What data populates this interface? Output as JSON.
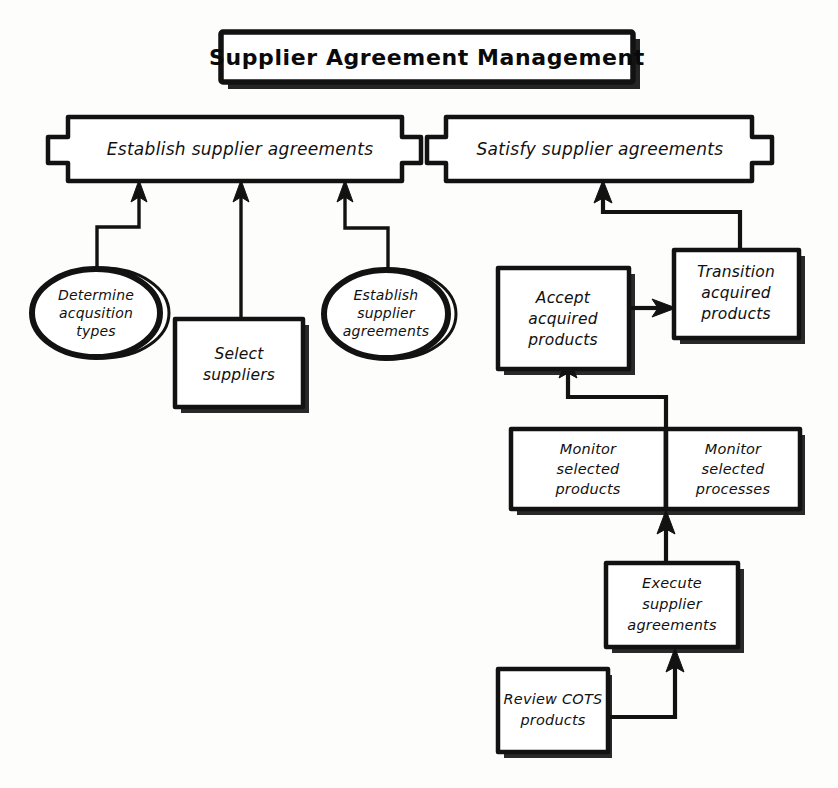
{
  "diagram": {
    "title": "Supplier Agreement Management",
    "style": "hand-drawn flowchart",
    "ink_color": "#121212",
    "background_color": "#fdfdfc",
    "process_areas": [
      {
        "id": "establish",
        "label": "Establish supplier agreements"
      },
      {
        "id": "satisfy",
        "label": "Satisfy supplier agreements"
      }
    ],
    "nodes": [
      {
        "id": "determine-acquisition-types",
        "shape": "ellipse",
        "label_lines": [
          "Determine",
          "acqusition",
          "types"
        ]
      },
      {
        "id": "select-suppliers",
        "shape": "box",
        "label_lines": [
          "Select",
          "suppliers"
        ]
      },
      {
        "id": "establish-supplier-agreements",
        "shape": "ellipse",
        "label_lines": [
          "Establish",
          "supplier",
          "agreements"
        ]
      },
      {
        "id": "accept-acquired-products",
        "shape": "box",
        "label_lines": [
          "Accept",
          "acquired",
          "products"
        ]
      },
      {
        "id": "transition-acquired-products",
        "shape": "box",
        "label_lines": [
          "Transition",
          "acquired",
          "products"
        ]
      },
      {
        "id": "monitor-selected-products",
        "shape": "box",
        "label_lines": [
          "Monitor",
          "selected",
          "products"
        ]
      },
      {
        "id": "monitor-selected-processes",
        "shape": "box",
        "label_lines": [
          "Monitor",
          "selected",
          "processes"
        ]
      },
      {
        "id": "execute-supplier-agreements",
        "shape": "box",
        "label_lines": [
          "Execute",
          "supplier",
          "agreements"
        ]
      },
      {
        "id": "review-cots-products",
        "shape": "box",
        "label_lines": [
          "Review COTS",
          "products"
        ]
      }
    ],
    "edges": [
      {
        "from": "determine-acquisition-types",
        "to": "establish",
        "style": "elbow-arrow"
      },
      {
        "from": "select-suppliers",
        "to": "establish",
        "style": "straight-arrow"
      },
      {
        "from": "establish-supplier-agreements",
        "to": "establish",
        "style": "elbow-arrow"
      },
      {
        "from": "transition-acquired-products",
        "to": "satisfy",
        "style": "elbow-arrow"
      },
      {
        "from": "accept-acquired-products",
        "to": "transition-acquired-products",
        "style": "straight-arrow"
      },
      {
        "from": "monitor-selected-products",
        "to": "accept-acquired-products",
        "style": "elbow-arrow"
      },
      {
        "from": "execute-supplier-agreements",
        "to": "monitor-selected-products",
        "style": "straight-arrow"
      },
      {
        "from": "review-cots-products",
        "to": "execute-supplier-agreements",
        "style": "elbow-arrow"
      }
    ]
  },
  "labels": {
    "title": "Supplier Agreement Management",
    "establish_area": "Establish supplier agreements",
    "satisfy_area": "Satisfy supplier agreements",
    "determine_1": "Determine",
    "determine_2": "acqusition",
    "determine_3": "types",
    "select_1": "Select",
    "select_2": "suppliers",
    "estab_1": "Establish",
    "estab_2": "supplier",
    "estab_3": "agreements",
    "accept_1": "Accept",
    "accept_2": "acquired",
    "accept_3": "products",
    "transition_1": "Transition",
    "transition_2": "acquired",
    "transition_3": "products",
    "monprod_1": "Monitor",
    "monprod_2": "selected",
    "monprod_3": "products",
    "monproc_1": "Monitor",
    "monproc_2": "selected",
    "monproc_3": "processes",
    "execute_1": "Execute",
    "execute_2": "supplier",
    "execute_3": "agreements",
    "review_1": "Review COTS",
    "review_2": "products"
  }
}
